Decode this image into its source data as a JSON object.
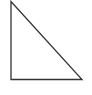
{
  "diagram": {
    "shape": "right-triangle",
    "stroke_color": "#333333",
    "fill_color": "#ffffff",
    "stroke_width": 1.3,
    "vertices": [
      {
        "name": "top",
        "x": 11,
        "y": 1.5
      },
      {
        "name": "bottom-left",
        "x": 11,
        "y": 79.5
      },
      {
        "name": "bottom-right",
        "x": 82,
        "y": 79.5
      }
    ]
  }
}
